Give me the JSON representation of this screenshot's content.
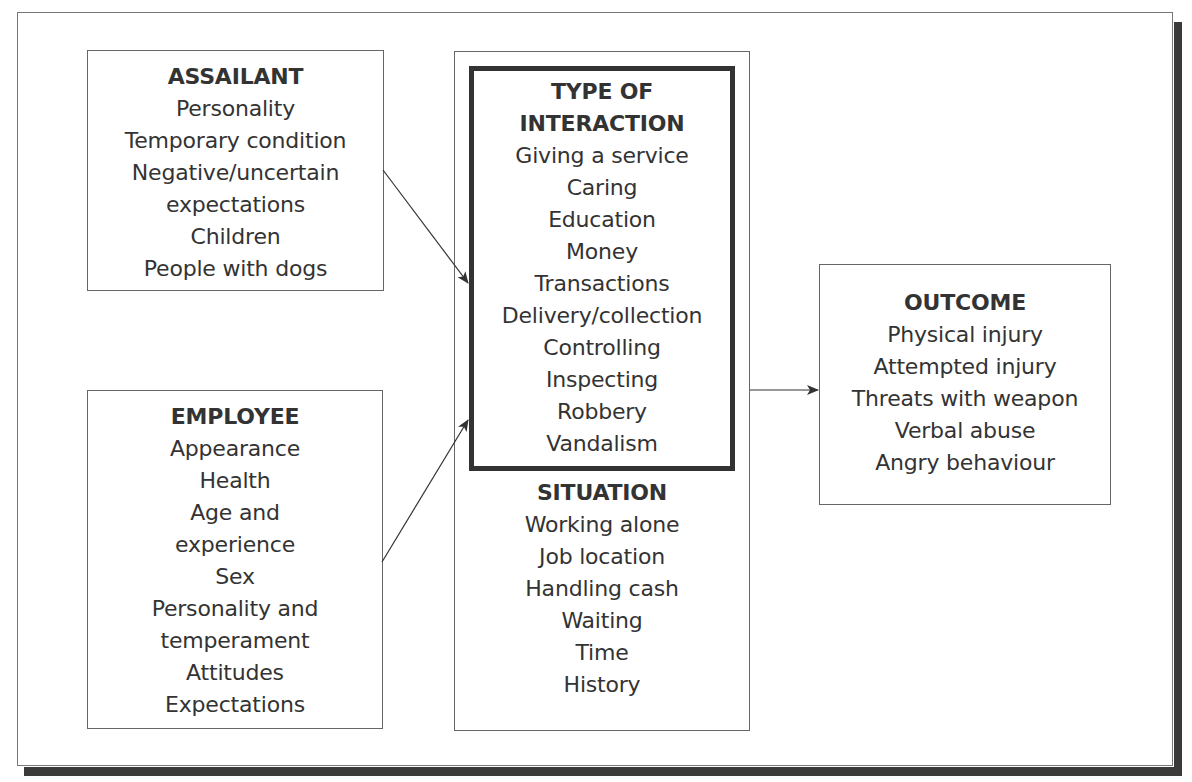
{
  "diagram": {
    "assailant": {
      "title": "ASSAILANT",
      "items": [
        "Personality",
        "Temporary condition",
        "Negative/uncertain",
        "expectations",
        "Children",
        "People with dogs"
      ]
    },
    "employee": {
      "title": "EMPLOYEE",
      "items": [
        "Appearance",
        "Health",
        "Age and",
        "experience",
        "Sex",
        "Personality and",
        "temperament",
        "Attitudes",
        "Expectations"
      ]
    },
    "interaction": {
      "title_lines": [
        "TYPE OF",
        "INTERACTION"
      ],
      "items": [
        "Giving a service",
        "Caring",
        "Education",
        "Money",
        "Transactions",
        "Delivery/collection",
        "Controlling",
        "Inspecting",
        "Robbery",
        "Vandalism"
      ]
    },
    "situation": {
      "title": "SITUATION",
      "items": [
        "Working alone",
        "Job location",
        "Handling cash",
        "Waiting",
        "Time",
        "History"
      ]
    },
    "outcome": {
      "title": "OUTCOME",
      "items": [
        "Physical injury",
        "Attempted injury",
        "Threats with weapon",
        "Verbal abuse",
        "Angry behaviour"
      ]
    },
    "edges": [
      {
        "from": "assailant",
        "to": "interaction"
      },
      {
        "from": "employee",
        "to": "interaction"
      },
      {
        "from": "interaction-situation",
        "to": "outcome"
      }
    ],
    "colors": {
      "line": "#333333",
      "border": "#666666",
      "shadow": "#3a3a3a"
    }
  }
}
